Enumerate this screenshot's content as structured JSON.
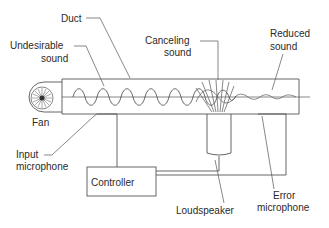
{
  "diagram": {
    "labels": {
      "duct": "Duct",
      "undesirable_sound_1": "Undesirable",
      "undesirable_sound_2": "sound",
      "canceling_sound_1": "Canceling",
      "canceling_sound_2": "sound",
      "reduced_sound_1": "Reduced",
      "reduced_sound_2": "sound",
      "fan": "Fan",
      "input_microphone_1": "Input",
      "input_microphone_2": "microphone",
      "controller": "Controller",
      "loudspeaker": "Loudspeaker",
      "error_microphone_1": "Error",
      "error_microphone_2": "microphone"
    },
    "components": [
      "Duct",
      "Fan",
      "Input microphone",
      "Controller",
      "Loudspeaker",
      "Error microphone"
    ],
    "colors": {
      "line": "#555555",
      "text": "#2a2a2a",
      "background": "#ffffff"
    }
  }
}
